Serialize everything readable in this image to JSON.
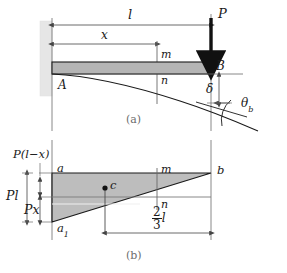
{
  "figure": {
    "colors": {
      "line": "#1a1a1a",
      "beam_fill": "#b5b5b5",
      "wall_fill": "#e6e6e6",
      "diagram_fill": "#bdbdbd",
      "thin_line": "#555555",
      "caption_text": "#6d6d6d"
    },
    "panel_a": {
      "caption": "(a)",
      "dim_length_label": "l",
      "dim_x_label": "x",
      "load_label": "P",
      "support_label": "A",
      "free_end_label": "B",
      "section_top_label": "m",
      "section_bottom_label": "n",
      "deflection_label": "δ",
      "slope_label": "θ",
      "slope_sub": "b"
    },
    "panel_b": {
      "caption": "(b)",
      "top_left_label": "a",
      "bottom_left_label": "a",
      "bottom_left_sub": "1",
      "right_label": "b",
      "centroid_label": "c",
      "section_top_label": "m",
      "section_bottom_label": "n",
      "ordinate_label": "P(l−x)",
      "total_moment_label": "Pl",
      "partial_moment_label": "Px",
      "centroid_distance_num": "2",
      "centroid_distance_den": "3",
      "centroid_distance_unit": "l"
    }
  }
}
